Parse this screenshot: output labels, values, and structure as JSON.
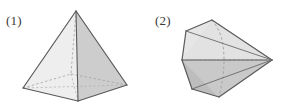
{
  "page": {
    "width": 282,
    "height": 109,
    "background": "#ffffff"
  },
  "palette": {
    "outline": "#5a5a5a",
    "outline_dark": "#4a4a4a",
    "hidden_edge": "#9a9a9a",
    "face_light": "#f2f2f2",
    "face_mid": "#dedede",
    "face_shade": "#cfcfcf",
    "face_dark": "#bfbfbf",
    "face_darkest": "#b2b2b2",
    "label_color": "#3a3a3a"
  },
  "figures": [
    {
      "id": "figure-1",
      "label": "(1)",
      "name": "square-pyramid",
      "solid_type": "square pyramid",
      "apex": {
        "x": 76,
        "y": 11
      },
      "base_vertices": [
        {
          "name": "left",
          "x": 23,
          "y": 88,
          "hidden": false
        },
        {
          "name": "front",
          "x": 78,
          "y": 101,
          "hidden": false
        },
        {
          "name": "right",
          "x": 127,
          "y": 85,
          "hidden": false
        },
        {
          "name": "back",
          "x": 71,
          "y": 74,
          "hidden": true
        }
      ],
      "visible_faces": [
        {
          "name": "left-face",
          "fill": "#eeeeee"
        },
        {
          "name": "right-face",
          "fill": "#cdcdcd"
        }
      ],
      "hidden_edges": [
        "back-to-left",
        "back-to-right",
        "back-to-front-diagonal",
        "apex-to-back"
      ]
    },
    {
      "id": "figure-2",
      "label": "(2)",
      "name": "hexagonal-pyramid-sideways",
      "solid_type": "hexagonal pyramid viewed from the side, apex pointing right",
      "apex": {
        "x": 272,
        "y": 60
      },
      "base_vertices": [
        {
          "name": "top-back",
          "x": 212,
          "y": 20,
          "hidden": false
        },
        {
          "name": "top-front",
          "x": 186,
          "y": 31,
          "hidden": false
        },
        {
          "name": "left-upper",
          "x": 182,
          "y": 60,
          "hidden": false
        },
        {
          "name": "bottom-front",
          "x": 192,
          "y": 89,
          "hidden": false
        },
        {
          "name": "bottom-back",
          "x": 219,
          "y": 97,
          "hidden": false
        },
        {
          "name": "right-inner",
          "x": 239,
          "y": 60,
          "hidden": true
        }
      ],
      "visible_faces": [
        {
          "name": "base-face-upper",
          "fill": "#e4e4e4"
        },
        {
          "name": "base-face-lower",
          "fill": "#dadada"
        },
        {
          "name": "upper-lateral",
          "fill": "#e9e9e9"
        },
        {
          "name": "lower-lateral",
          "fill": "#c6c6c6"
        },
        {
          "name": "bottom-lateral",
          "fill": "#bdbdbd"
        }
      ],
      "hidden_edges": [
        "curved-back-profile",
        "axis-to-apex"
      ]
    }
  ]
}
